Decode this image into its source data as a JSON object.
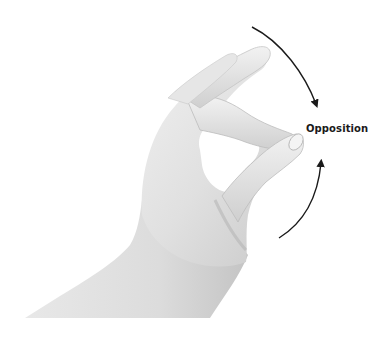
{
  "figure": {
    "label": "Opposition",
    "arrows": [
      {
        "name": "upper-arrow",
        "direction": "clockwise-down"
      },
      {
        "name": "lower-arrow",
        "direction": "counterclockwise-up"
      }
    ],
    "colors": {
      "background": "#ffffff",
      "skin_light": "#eeeeee",
      "skin_mid": "#d6d6d6",
      "skin_shadow": "#b8b8b8",
      "arrow": "#1a1a1a",
      "text": "#1a1a1a"
    }
  }
}
